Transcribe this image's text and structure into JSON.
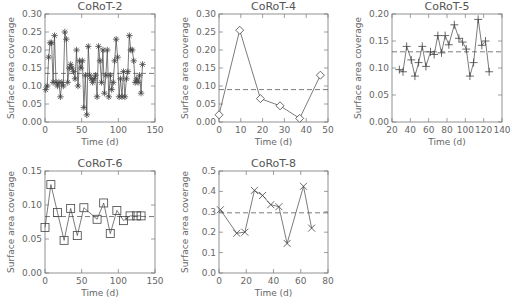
{
  "chart_data": [
    {
      "type": "line",
      "title": "CoRoT-2",
      "xlabel": "Time (d)",
      "ylabel": "Surface area coverage",
      "xlim": [
        0,
        150
      ],
      "ylim": [
        0,
        0.3
      ],
      "xticks": [
        0,
        50,
        100,
        150
      ],
      "yticks": [
        0.0,
        0.05,
        0.1,
        0.15,
        0.2,
        0.25,
        0.3
      ],
      "ytick_labels": [
        "0.00",
        "0.05",
        "0.10",
        "0.15",
        "0.20",
        "0.25",
        "0.30"
      ],
      "marker": "asterisk",
      "mean_line": 0.135,
      "x": [
        1,
        3,
        5,
        7,
        9,
        11,
        13,
        15,
        17,
        19,
        21,
        23,
        25,
        27,
        29,
        31,
        33,
        35,
        37,
        39,
        41,
        43,
        45,
        47,
        49,
        51,
        53,
        55,
        57,
        59,
        61,
        63,
        65,
        67,
        69,
        71,
        73,
        75,
        77,
        79,
        81,
        83,
        85,
        87,
        89,
        91,
        93,
        95,
        97,
        99,
        101,
        103,
        105,
        107,
        109,
        111,
        113,
        115,
        117,
        119,
        121,
        123,
        125,
        127,
        129,
        131,
        133
      ],
      "values": [
        0.09,
        0.1,
        0.18,
        0.22,
        0.22,
        0.11,
        0.24,
        0.11,
        0.1,
        0.11,
        0.07,
        0.11,
        0.1,
        0.25,
        0.23,
        0.11,
        0.15,
        0.16,
        0.15,
        0.14,
        0.12,
        0.2,
        0.1,
        0.17,
        0.15,
        0.17,
        0.04,
        0.13,
        0.02,
        0.21,
        0.13,
        0.12,
        0.11,
        0.12,
        0.13,
        0.07,
        0.21,
        0.17,
        0.11,
        0.2,
        0.08,
        0.13,
        0.2,
        0.07,
        0.13,
        0.09,
        0.11,
        0.17,
        0.23,
        0.18,
        0.07,
        0.12,
        0.07,
        0.14,
        0.07,
        0.12,
        0.14,
        0.24,
        0.2,
        0.2,
        0.17,
        0.11,
        0.12,
        0.11,
        0.13,
        0.08,
        0.16
      ]
    },
    {
      "type": "line",
      "title": "CoRoT-4",
      "xlabel": "Time (d)",
      "ylabel": "Surface area coverage",
      "xlim": [
        0,
        50
      ],
      "ylim": [
        0,
        0.3
      ],
      "xticks": [
        0,
        10,
        20,
        30,
        40,
        50
      ],
      "yticks": [
        0.0,
        0.05,
        0.1,
        0.15,
        0.2,
        0.25,
        0.3
      ],
      "ytick_labels": [
        "0.00",
        "0.05",
        "0.10",
        "0.15",
        "0.20",
        "0.25",
        "0.30"
      ],
      "marker": "diamond",
      "mean_line": 0.09,
      "x": [
        0,
        9.5,
        19,
        28,
        37,
        46.5
      ],
      "values": [
        0.02,
        0.255,
        0.065,
        0.045,
        0.01,
        0.13
      ]
    },
    {
      "type": "line",
      "title": "CoRoT-5",
      "xlabel": "Time (d)",
      "ylabel": "Surface area coverage",
      "xlim": [
        20,
        140
      ],
      "ylim": [
        0,
        0.2
      ],
      "xticks": [
        20,
        40,
        60,
        80,
        100,
        120,
        140
      ],
      "yticks": [
        0.0,
        0.05,
        0.1,
        0.15,
        0.2
      ],
      "ytick_labels": [
        "0.00",
        "0.05",
        "0.10",
        "0.15",
        "0.20"
      ],
      "marker": "plus",
      "mean_line": 0.13,
      "x": [
        28,
        32,
        36,
        41,
        45,
        49,
        53,
        57,
        62,
        66,
        70,
        74,
        78,
        82,
        88,
        93,
        97,
        101,
        105,
        109,
        114,
        118,
        122,
        126
      ],
      "values": [
        0.097,
        0.093,
        0.14,
        0.115,
        0.085,
        0.11,
        0.14,
        0.103,
        0.13,
        0.125,
        0.16,
        0.128,
        0.16,
        0.143,
        0.18,
        0.155,
        0.148,
        0.135,
        0.085,
        0.11,
        0.19,
        0.142,
        0.15,
        0.093
      ]
    },
    {
      "type": "line",
      "title": "CoRoT-6",
      "xlabel": "Time (d)",
      "ylabel": "Surface area coverage",
      "xlim": [
        0,
        150
      ],
      "ylim": [
        0,
        0.15
      ],
      "xticks": [
        0,
        50,
        100,
        150
      ],
      "yticks": [
        0.0,
        0.05,
        0.1,
        0.15
      ],
      "ytick_labels": [
        "0.00",
        "0.05",
        "0.10",
        "0.15"
      ],
      "marker": "square",
      "mean_line": 0.083,
      "x": [
        0,
        8,
        17,
        26,
        35,
        44,
        53,
        71,
        80,
        89,
        98,
        107,
        116,
        125,
        131
      ],
      "values": [
        0.067,
        0.13,
        0.089,
        0.048,
        0.095,
        0.055,
        0.096,
        0.079,
        0.103,
        0.058,
        0.092,
        0.077,
        0.084,
        0.084,
        0.084
      ]
    },
    {
      "type": "line",
      "title": "CoRoT-8",
      "xlabel": "Time (d)",
      "ylabel": "Surface area coverage",
      "xlim": [
        0,
        80
      ],
      "ylim": [
        0,
        0.5
      ],
      "xticks": [
        0,
        20,
        40,
        60,
        80
      ],
      "yticks": [
        0.0,
        0.1,
        0.2,
        0.3,
        0.4,
        0.5
      ],
      "ytick_labels": [
        "0.0",
        "0.1",
        "0.2",
        "0.3",
        "0.4",
        "0.5"
      ],
      "marker": "cross",
      "mean_line": 0.295,
      "x": [
        1,
        13,
        19,
        26,
        32,
        38,
        44,
        50,
        62,
        68
      ],
      "values": [
        0.31,
        0.195,
        0.2,
        0.405,
        0.38,
        0.335,
        0.325,
        0.145,
        0.425,
        0.22
      ]
    }
  ],
  "layout": {
    "panels": [
      {
        "x0": 45,
        "x1": 155,
        "y0": 14,
        "y1": 122
      },
      {
        "x0": 219,
        "x1": 328,
        "y0": 14,
        "y1": 122
      },
      {
        "x0": 392,
        "x1": 502,
        "y0": 14,
        "y1": 122
      },
      {
        "x0": 45,
        "x1": 155,
        "y0": 171,
        "y1": 273
      },
      {
        "x0": 219,
        "x1": 328,
        "y0": 171,
        "y1": 273
      }
    ]
  }
}
